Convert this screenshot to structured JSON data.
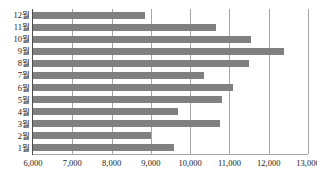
{
  "chart_data": {
    "type": "bar",
    "orientation": "horizontal",
    "title": "",
    "title_remnant": "",
    "xlabel": "",
    "ylabel": "",
    "categories": [
      "1월",
      "2월",
      "3월",
      "4월",
      "5월",
      "6월",
      "7월",
      "8월",
      "9월",
      "10월",
      "11월",
      "12월"
    ],
    "values": [
      9600,
      9000,
      10750,
      9700,
      10800,
      11100,
      10350,
      11500,
      12400,
      11550,
      10650,
      8850
    ],
    "xlim": [
      6000,
      13000
    ],
    "xticks": [
      6000,
      7000,
      8000,
      9000,
      10000,
      11000,
      12000,
      13000
    ],
    "xtick_labels": [
      "6,000",
      "7,000",
      "8,000",
      "9,000",
      "10,000",
      "11,000",
      "12,000",
      "13,000"
    ],
    "grid": true,
    "grid_axis": "x",
    "legend": false,
    "bar_color": "#808080",
    "grid_color": "#a6a6a6",
    "axis_color": "#4d4d4d",
    "background": "#ffffff"
  }
}
